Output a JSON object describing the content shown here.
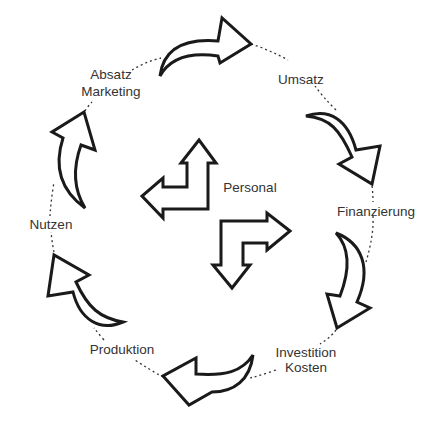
{
  "diagram": {
    "type": "cycle",
    "colors": {
      "stroke": "#1a1a1a",
      "text": "#333333",
      "background": "#ffffff"
    },
    "center": {
      "label": "Personal"
    },
    "nodes": [
      {
        "id": "absatz",
        "lines": [
          "Absatz",
          "Marketing"
        ]
      },
      {
        "id": "umsatz",
        "lines": [
          "Umsatz"
        ]
      },
      {
        "id": "finanzierung",
        "lines": [
          "Finanzierung"
        ]
      },
      {
        "id": "investition",
        "lines": [
          "Investition",
          "Kosten"
        ]
      },
      {
        "id": "produktion",
        "lines": [
          "Produktion"
        ]
      },
      {
        "id": "nutzen",
        "lines": [
          "Nutzen"
        ]
      }
    ],
    "flow": [
      {
        "from": "Absatz Marketing",
        "to": "Umsatz"
      },
      {
        "from": "Umsatz",
        "to": "Finanzierung"
      },
      {
        "from": "Finanzierung",
        "to": "Investition Kosten"
      },
      {
        "from": "Investition Kosten",
        "to": "Produktion"
      },
      {
        "from": "Produktion",
        "to": "Nutzen"
      },
      {
        "from": "Nutzen",
        "to": "Absatz Marketing"
      }
    ]
  }
}
